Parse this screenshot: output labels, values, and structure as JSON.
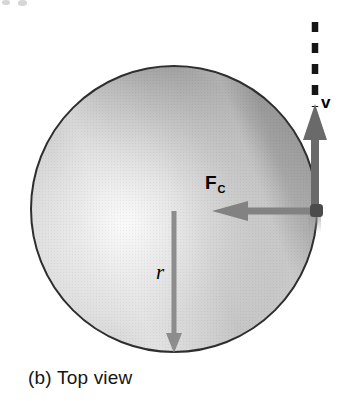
{
  "figure": {
    "caption": "(b) Top view",
    "labels": {
      "velocity": "v",
      "force_main": "F",
      "force_sub": "C",
      "radius": "r"
    },
    "vectors": [
      {
        "id": "velocity",
        "label": "v",
        "direction": "up",
        "style": "solid arrow with dashed trajectory line continuing upward",
        "origin": "right edge of disk"
      },
      {
        "id": "centripetal-force",
        "label": "F_C",
        "direction": "left, toward center",
        "style": "solid arrow",
        "origin": "right edge of disk"
      },
      {
        "id": "radius",
        "label": "r",
        "direction": "down, center to rim",
        "style": "solid arrow",
        "origin": "center of disk"
      }
    ],
    "colors": {
      "velocity_arrow": "#6a6a6a",
      "force_arrow": "#828282",
      "radius_arrow": "#8d8d8d",
      "dashed_line": "#161616",
      "contact_dot": "#4b4b4b",
      "circle_outline": "#2e2e2e",
      "label_text": "#000000"
    }
  }
}
